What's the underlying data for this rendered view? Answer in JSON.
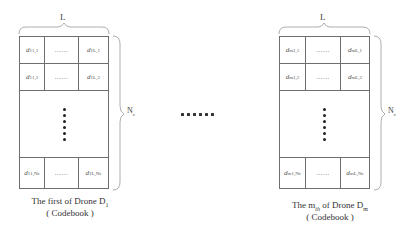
{
  "width_label": "L",
  "height_label": "N",
  "height_label_sub": "c",
  "separator": "......",
  "tables": [
    {
      "id": "first",
      "rows": [
        [
          {
            "base": "d",
            "sup": "1",
            "sub": "1,1"
          },
          {
            "text": "......"
          },
          {
            "base": "d",
            "sup": "1",
            "sub": "L,1"
          }
        ],
        [
          {
            "base": "d",
            "sup": "1",
            "sub": "1,2"
          },
          {
            "text": "......"
          },
          {
            "base": "d",
            "sup": "1",
            "sub": "L,2"
          }
        ],
        [
          {
            "base": "d",
            "sup": "1",
            "sub": "1,Nc"
          },
          {
            "text": "......"
          },
          {
            "base": "d",
            "sup": "1",
            "sub": "L,Nc"
          }
        ]
      ],
      "caption_line1": "The first of Drone  D",
      "caption_line1_sub": "1",
      "caption_line2": "( Codebook )"
    },
    {
      "id": "mth",
      "rows": [
        [
          {
            "base": "d",
            "sup": "m",
            "sub": "1,1"
          },
          {
            "text": "......"
          },
          {
            "base": "d",
            "sup": "m",
            "sub": "L,1"
          }
        ],
        [
          {
            "base": "d",
            "sup": "m",
            "sub": "1,2"
          },
          {
            "text": "......"
          },
          {
            "base": "d",
            "sup": "m",
            "sub": "L,2"
          }
        ],
        [
          {
            "base": "d",
            "sup": "m",
            "sub": "1,Nc"
          },
          {
            "text": "......"
          },
          {
            "base": "d",
            "sup": "m",
            "sub": "L,Nc"
          }
        ]
      ],
      "caption_line1_a": "The  m",
      "caption_line1_a_sub": "th",
      "caption_line1_b": "  of Drone  D",
      "caption_line1_b_sub": "m",
      "caption_line2": "( Codebook )"
    }
  ]
}
